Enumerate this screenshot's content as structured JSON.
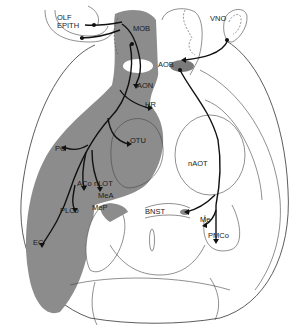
{
  "diagram": {
    "colors": {
      "main_olfactory_region": "#8c8c8c",
      "accessory_region": "#7a7a7a",
      "outline": "#333333",
      "pathway": "#111111",
      "background": "#ffffff"
    },
    "labels": {
      "olf_epith_line1": "OLF",
      "olf_epith_line2": "EPITH",
      "mob": "MOB",
      "aon": "AON",
      "hr": "HR",
      "otu": "OTU",
      "pc": "PC",
      "aco": "ACo",
      "nlot": "nLOT",
      "mea": "MeA",
      "mep": "MeP",
      "plco": "PLCo",
      "ec": "EC",
      "vno": "VNO",
      "aob": "AOB",
      "bnst": "BNST",
      "naot": "nAOT",
      "me": "Me",
      "pmco": "PMCo"
    }
  }
}
